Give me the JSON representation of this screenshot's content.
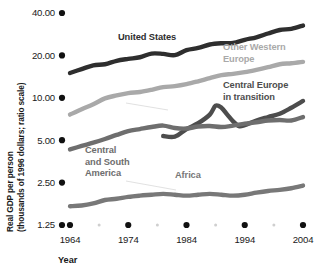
{
  "chart_data": {
    "type": "line",
    "title": "",
    "xlabel": "Year",
    "ylabel": "Real GDP per person (thousands of 1996 dollars; ratio scale)",
    "ylabel_line1": "Real GDP per person",
    "ylabel_line2": "(thousands of 1996 dollars; ratio scale)",
    "scale": "log",
    "grid": false,
    "legend_position": "inline-annotations",
    "ylim": [
      1.25,
      40.0
    ],
    "xlim": [
      1964,
      2004
    ],
    "ytick_labels": [
      "40.00",
      "20.00",
      "10.00",
      "5.00",
      "2.50",
      "1.25"
    ],
    "ytick_values": [
      40.0,
      20.0,
      10.0,
      5.0,
      2.5,
      1.25
    ],
    "xtick_labels": [
      "1964",
      "1974",
      "1984",
      "1994",
      "2004"
    ],
    "xtick_values": [
      1964,
      1974,
      1984,
      1994,
      2004
    ],
    "xminor_ticks": [
      1969,
      1979,
      1989,
      1999
    ],
    "series": [
      {
        "name": "United States",
        "color": "#2e2e2e",
        "label_x": 118,
        "label_y": 40,
        "x": [
          1964,
          1966,
          1968,
          1970,
          1972,
          1974,
          1976,
          1978,
          1980,
          1982,
          1984,
          1986,
          1988,
          1990,
          1992,
          1994,
          1996,
          1998,
          2000,
          2002,
          2004
        ],
        "values": [
          15.0,
          16.0,
          17.0,
          17.3,
          18.3,
          18.9,
          19.4,
          20.6,
          20.5,
          20.1,
          21.8,
          22.6,
          23.9,
          24.4,
          24.5,
          25.8,
          26.9,
          28.6,
          30.3,
          30.9,
          32.6
        ]
      },
      {
        "name": "Other Western Europe",
        "color": "#a9a9a9",
        "label_x": 223,
        "label_y": 50,
        "label_line1": "Other Western",
        "label_line2": "Europe",
        "x": [
          1964,
          1966,
          1968,
          1970,
          1972,
          1974,
          1976,
          1978,
          1980,
          1982,
          1984,
          1986,
          1988,
          1990,
          1992,
          1994,
          1996,
          1998,
          2000,
          2002,
          2004
        ],
        "values": [
          7.6,
          8.3,
          9.0,
          9.9,
          10.4,
          10.8,
          11.0,
          11.4,
          11.9,
          12.1,
          12.5,
          13.1,
          13.8,
          14.5,
          14.8,
          15.2,
          15.8,
          16.5,
          17.3,
          17.6,
          18.0
        ]
      },
      {
        "name": "Central Europe in transition",
        "color": "#4d4d4d",
        "label_x": 223,
        "label_y": 88,
        "label_line1": "Central Europe",
        "label_line2": "in transition",
        "x": [
          1980,
          1982,
          1984,
          1986,
          1988,
          1989,
          1990,
          1991,
          1992,
          1993,
          1994,
          1996,
          1998,
          2000,
          2002,
          2004
        ],
        "values": [
          5.35,
          5.3,
          6.0,
          6.6,
          7.6,
          8.8,
          8.5,
          7.6,
          6.8,
          6.3,
          6.4,
          6.9,
          7.3,
          7.7,
          8.5,
          9.5
        ]
      },
      {
        "name": "Central and South America",
        "color": "#6e6e6e",
        "label_x": 85,
        "label_y": 153,
        "label_line1": "Central",
        "label_line2": "and South",
        "label_line3": "America",
        "x": [
          1964,
          1966,
          1968,
          1970,
          1972,
          1974,
          1976,
          1978,
          1980,
          1982,
          1984,
          1986,
          1988,
          1990,
          1992,
          1994,
          1996,
          1998,
          2000,
          2002,
          2004
        ],
        "values": [
          4.3,
          4.55,
          4.8,
          5.1,
          5.45,
          5.8,
          6.0,
          6.2,
          6.35,
          6.1,
          6.05,
          6.25,
          6.3,
          6.2,
          6.35,
          6.55,
          6.7,
          6.9,
          6.95,
          6.9,
          7.3
        ]
      },
      {
        "name": "Africa",
        "color": "#787878",
        "label_x": 175,
        "label_y": 178,
        "x": [
          1964,
          1966,
          1968,
          1970,
          1972,
          1974,
          1976,
          1978,
          1980,
          1982,
          1984,
          1986,
          1988,
          1990,
          1992,
          1994,
          1996,
          1998,
          2000,
          2002,
          2004
        ],
        "values": [
          1.7,
          1.72,
          1.78,
          1.88,
          1.92,
          1.98,
          2.02,
          2.05,
          2.08,
          2.05,
          2.02,
          2.05,
          2.08,
          2.05,
          2.02,
          2.05,
          2.12,
          2.18,
          2.22,
          2.28,
          2.38
        ]
      }
    ]
  }
}
